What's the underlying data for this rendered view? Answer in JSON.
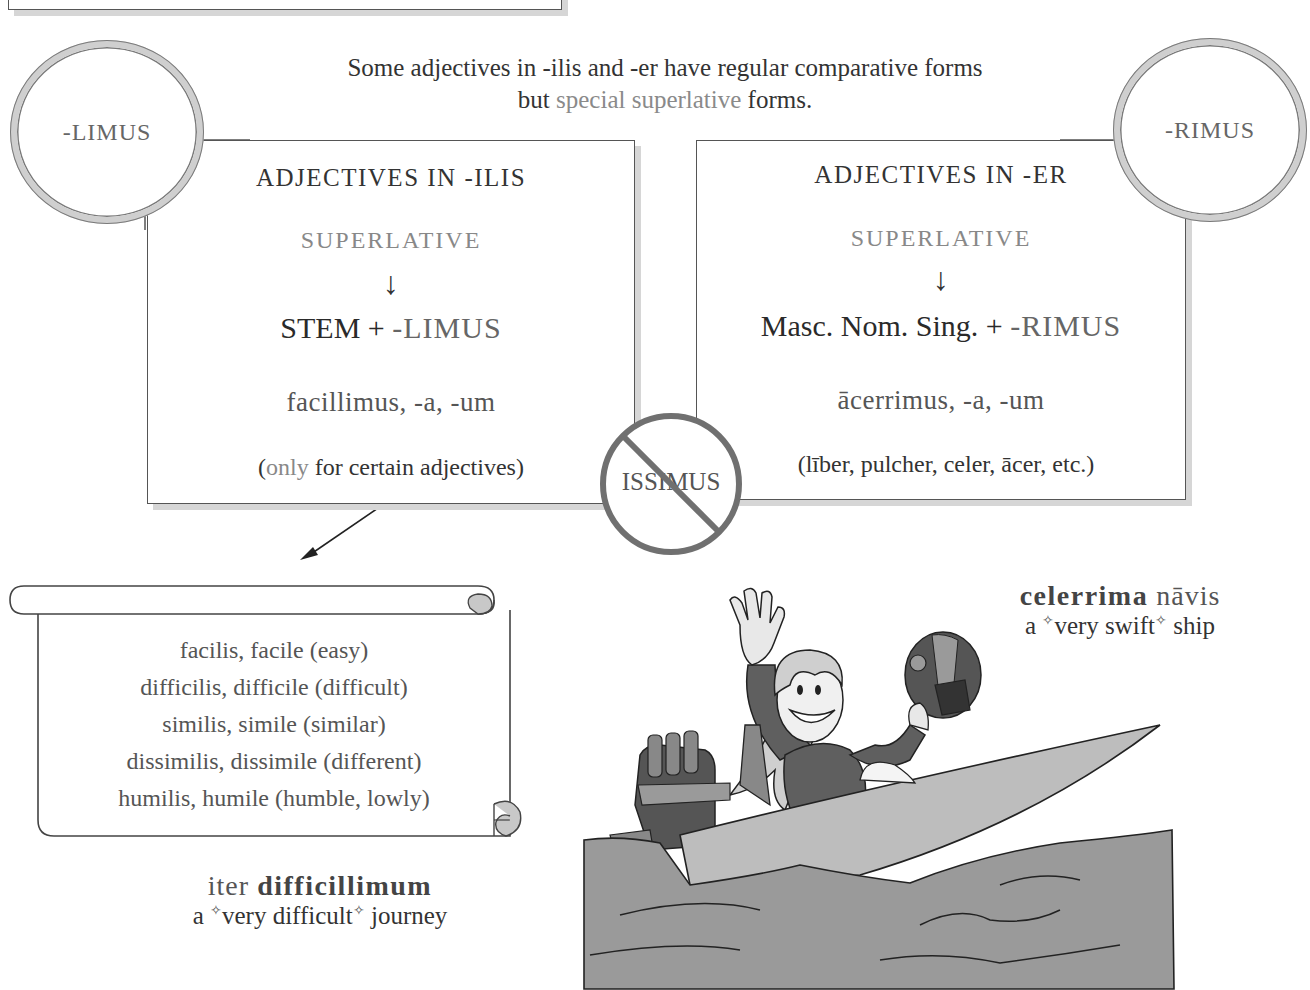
{
  "intro": {
    "line1": "Some adjectives in -ilis and -er have regular comparative forms",
    "line2_prefix": "but ",
    "line2_highlight": "special superlative",
    "line2_suffix": " forms."
  },
  "badges": {
    "left": "-LIMUS",
    "right": "-RIMUS",
    "prohibited": "ISSIMUS"
  },
  "panels": [
    {
      "heading": "ADJECTIVES IN -ILIS",
      "subheading": "SUPERLATIVE",
      "arrow": "↓",
      "formula_base": "STEM + ",
      "formula_suffix": "-LIMUS",
      "example": "facillimus, -a, -um",
      "note_open": "(",
      "note_highlight": "only",
      "note_rest": " for certain adjectives)"
    },
    {
      "heading": "ADJECTIVES IN -ER",
      "subheading": "SUPERLATIVE",
      "arrow": "↓",
      "formula_base": "Masc. Nom. Sing. + ",
      "formula_suffix": "-RIMUS",
      "example": "ācerrimus, -a, -um",
      "note_open": "",
      "note_highlight": "",
      "note_rest": "(līber, pulcher, celer, ācer, etc.)"
    }
  ],
  "scroll": {
    "items": [
      "facilis, facile  (easy)",
      "difficilis, difficile  (difficult)",
      "similis, simile  (similar)",
      "dissimilis, dissimile  (different)",
      "humilis, humile  (humble, lowly)"
    ]
  },
  "example_left": {
    "latin_plain": "iter ",
    "latin_bold": "difficillimum",
    "translation_pre": "a ",
    "star": "✧",
    "translation_em": "very difficult",
    "translation_post": " journey"
  },
  "example_right": {
    "latin_bold": "celerrima",
    "latin_plain": " nāvis",
    "translation_pre": "a ",
    "star": "✧",
    "translation_em": "very swift",
    "translation_post": " ship"
  },
  "illustration": {
    "subject": "woman waving in speedboat holding helmet"
  },
  "colors": {
    "border": "#555555",
    "shadow": "#d6d6d6",
    "circle_ring": "#cfcfcf",
    "prohibit": "#707070",
    "water": "#9a9a9a",
    "boat": "#bdbdbd"
  }
}
